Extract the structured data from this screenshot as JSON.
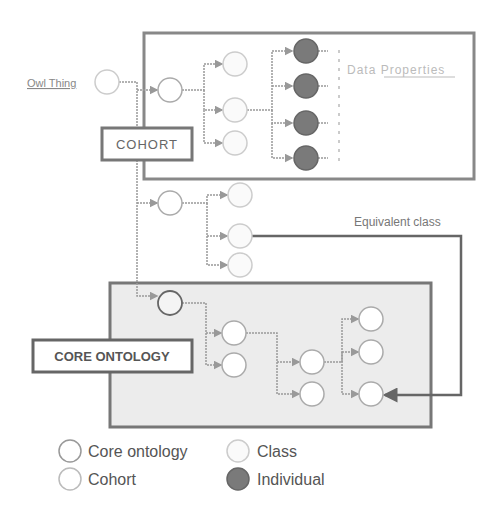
{
  "diagram": {
    "owl_thing_label": "Owl Thing",
    "cohort_label": "COHORT",
    "core_ontology_label": "CORE ONTOLOGY",
    "data_properties_label": "Data Properties",
    "equivalent_class_label": "Equivalent class"
  },
  "legend": {
    "items": [
      {
        "label": "Core ontology",
        "type": "core-ontology"
      },
      {
        "label": "Class",
        "type": "class"
      },
      {
        "label": "Cohort",
        "type": "cohort"
      },
      {
        "label": "Individual",
        "type": "individual"
      }
    ]
  },
  "colors": {
    "box_border": "#777777",
    "core_fill": "#ececec",
    "individual_fill": "#7a7a7a",
    "class_stroke": "#c8c8c8",
    "cohort_stroke": "#a8a8a8",
    "core_stroke": "#777777",
    "edge": "#9a9a9a"
  }
}
